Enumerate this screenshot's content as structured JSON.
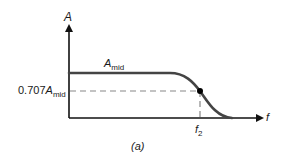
{
  "diagram": {
    "caption": "(a)",
    "y_axis_label": "A",
    "x_axis_label": "f",
    "curve_label": {
      "base": "A",
      "sub": "mid"
    },
    "level_label": {
      "prefix": "0.707",
      "base": "A",
      "sub": "mid"
    },
    "cutoff_label": {
      "base": "f",
      "sub": "2"
    },
    "colors": {
      "axis": "#111111",
      "curve": "#444444",
      "dashed": "#888888",
      "dot": "#000000"
    }
  }
}
